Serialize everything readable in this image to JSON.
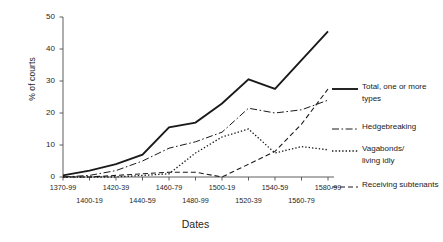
{
  "chart_data": {
    "type": "line",
    "title": "",
    "xlabel": "Dates",
    "ylabel": "% of courts",
    "ylim": [
      0,
      50
    ],
    "yticks": [
      0,
      10,
      20,
      30,
      40,
      50
    ],
    "grid": false,
    "legend_position": "right",
    "categories": [
      "1370-99",
      "1400-19",
      "1420-39",
      "1440-59",
      "1460-79",
      "1480-99",
      "1500-19",
      "1520-39",
      "1540-59",
      "1560-79",
      "1580-99"
    ],
    "series": [
      {
        "name": "Total, one or more types",
        "style": "solid",
        "values": [
          0.5,
          2,
          4,
          7,
          15.5,
          17,
          23,
          30.5,
          27.5,
          36.5,
          45.5
        ]
      },
      {
        "name": "Hedgebreaking",
        "style": "dash-dot",
        "values": [
          0,
          0.5,
          2,
          5,
          9,
          11,
          14,
          21.5,
          20,
          21,
          24
        ]
      },
      {
        "name": "Vagabonds/living idly",
        "style": "dotted",
        "values": [
          0,
          0,
          0,
          0.5,
          1,
          7.5,
          12.5,
          15,
          7.5,
          9.5,
          8.5
        ]
      },
      {
        "name": "Receiving subtenants",
        "style": "dashed",
        "values": [
          0,
          0,
          0.5,
          1,
          1.5,
          1.5,
          0,
          4,
          8,
          16.5,
          27.5
        ]
      }
    ]
  },
  "legend": {
    "entries": [
      {
        "label": "Total, one or more\ntypes",
        "swatch": "solid-line-swatch"
      },
      {
        "label": "Hedgebreaking",
        "swatch": "dash-dot-line-swatch"
      },
      {
        "label": "Vagabonds/\nliving idly",
        "swatch": "dotted-line-swatch"
      },
      {
        "label": "Receiving subtenants",
        "swatch": "dashed-line-swatch"
      }
    ]
  }
}
